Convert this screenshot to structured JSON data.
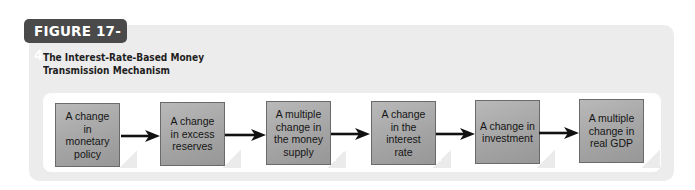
{
  "figure": {
    "label": "FIGURE 17-4",
    "title_line1": "The Interest-Rate-Based Money",
    "title_line2": "Transmission Mechanism"
  },
  "flow": {
    "steps": [
      {
        "label": "A change in monetary policy"
      },
      {
        "label": "A change in excess reserves"
      },
      {
        "label": "A multiple change in the money supply"
      },
      {
        "label": "A change in the interest rate"
      },
      {
        "label": "A change in investment"
      },
      {
        "label": "A multiple change in real GDP"
      }
    ],
    "connectors": [
      "arrow-right",
      "arrow-right",
      "arrow-right",
      "arrow-right",
      "arrow-right"
    ]
  },
  "colors": {
    "tag_bg": "#4a4a4a",
    "outer_bg": "#ececec",
    "box_fill": "#a8a8a8",
    "arrow": "#111111"
  }
}
